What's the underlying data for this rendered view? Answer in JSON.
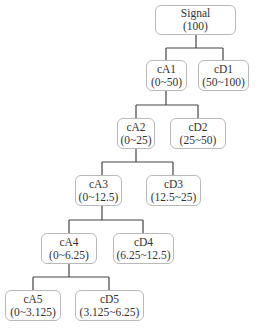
{
  "diagram": {
    "type": "wavelet-decomposition-tree",
    "nodes": [
      {
        "id": "signal",
        "name": "Signal",
        "range": "(100)"
      },
      {
        "id": "cA1",
        "name": "cA1",
        "range": "(0~50)"
      },
      {
        "id": "cD1",
        "name": "cD1",
        "range": "(50~100)"
      },
      {
        "id": "cA2",
        "name": "cA2",
        "range": "(0~25)"
      },
      {
        "id": "cD2",
        "name": "cD2",
        "range": "(25~50)"
      },
      {
        "id": "cA3",
        "name": "cA3",
        "range": "(0~12.5)"
      },
      {
        "id": "cD3",
        "name": "cD3",
        "range": "(12.5~25)"
      },
      {
        "id": "cA4",
        "name": "cA4",
        "range": "(0~6.25)"
      },
      {
        "id": "cD4",
        "name": "cD4",
        "range": "(6.25~12.5)"
      },
      {
        "id": "cA5",
        "name": "cA5",
        "range": "(0~3.125)"
      },
      {
        "id": "cD5",
        "name": "cD5",
        "range": "(3.125~6.25)"
      }
    ],
    "edges": [
      [
        "signal",
        "cA1"
      ],
      [
        "signal",
        "cD1"
      ],
      [
        "cA1",
        "cA2"
      ],
      [
        "cA1",
        "cD2"
      ],
      [
        "cA2",
        "cA3"
      ],
      [
        "cA2",
        "cD3"
      ],
      [
        "cA3",
        "cA4"
      ],
      [
        "cA3",
        "cD4"
      ],
      [
        "cA4",
        "cA5"
      ],
      [
        "cA4",
        "cD5"
      ]
    ],
    "colors": {
      "line": "#444444",
      "border": "#b9b9b9",
      "text": "#333333"
    }
  }
}
